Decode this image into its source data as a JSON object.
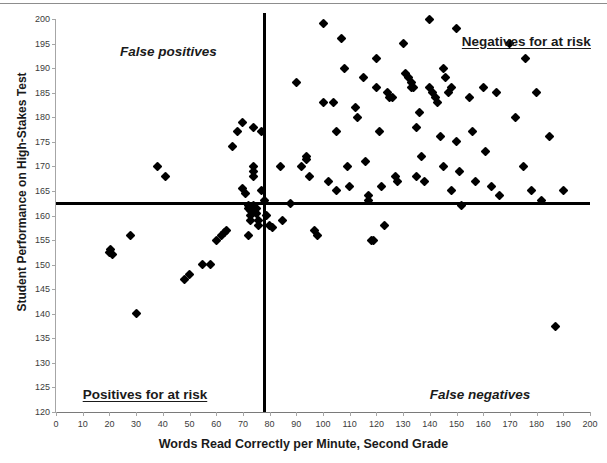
{
  "chart_data": {
    "type": "scatter",
    "title": "",
    "xlabel": "Words Read Correctly per Minute, Second Grade",
    "ylabel": "Student Performance on High-Stakes Test",
    "xlim": [
      0,
      200
    ],
    "ylim": [
      120,
      200
    ],
    "xticks": [
      0,
      10,
      20,
      30,
      40,
      50,
      60,
      70,
      80,
      90,
      100,
      110,
      120,
      130,
      140,
      150,
      160,
      170,
      180,
      190,
      200
    ],
    "yticks": [
      120,
      125,
      130,
      135,
      140,
      145,
      150,
      155,
      160,
      165,
      170,
      175,
      180,
      185,
      190,
      195,
      200
    ],
    "grid": false,
    "legend": "none",
    "marker": "diamond",
    "marker_color": "#000000",
    "thresholds": {
      "vertical_x": 78,
      "horizontal_y": 162.5,
      "line_color": "#000000"
    },
    "annotations": [
      {
        "text": "False positives",
        "x": 24,
        "y": 195,
        "style": "bold-italic",
        "quadrant": "upper-left"
      },
      {
        "text": "Negatives for at risk",
        "x": 152,
        "y": 197,
        "style": "bold-underline",
        "quadrant": "upper-right"
      },
      {
        "text": "Positives for at risk",
        "x": 10,
        "y": 125,
        "style": "bold-underline",
        "quadrant": "lower-left"
      },
      {
        "text": "False negatives",
        "x": 140,
        "y": 125,
        "style": "bold-italic",
        "quadrant": "lower-right"
      }
    ],
    "points": [
      [
        20,
        152.5
      ],
      [
        20.5,
        153
      ],
      [
        21,
        152
      ],
      [
        28,
        156
      ],
      [
        30,
        140
      ],
      [
        38,
        170
      ],
      [
        41,
        168
      ],
      [
        48,
        147
      ],
      [
        50,
        148
      ],
      [
        55,
        150
      ],
      [
        58,
        150
      ],
      [
        60,
        155
      ],
      [
        62,
        156
      ],
      [
        63,
        156.5
      ],
      [
        64,
        157
      ],
      [
        66,
        174
      ],
      [
        68,
        177
      ],
      [
        70,
        179
      ],
      [
        70,
        165.5
      ],
      [
        71,
        164.5
      ],
      [
        72,
        156
      ],
      [
        72,
        162
      ],
      [
        72,
        161.5
      ],
      [
        73,
        161
      ],
      [
        73,
        160
      ],
      [
        73,
        159
      ],
      [
        74,
        178
      ],
      [
        74,
        170
      ],
      [
        74,
        169
      ],
      [
        74,
        168
      ],
      [
        74,
        162
      ],
      [
        75,
        161.5
      ],
      [
        75,
        160.5
      ],
      [
        76,
        158
      ],
      [
        76,
        159
      ],
      [
        77,
        177
      ],
      [
        77,
        165
      ],
      [
        78,
        163
      ],
      [
        79,
        160
      ],
      [
        80,
        158
      ],
      [
        81,
        157.5
      ],
      [
        84,
        170
      ],
      [
        85,
        159
      ],
      [
        88,
        162.5
      ],
      [
        90,
        187
      ],
      [
        92,
        170
      ],
      [
        94,
        171.5
      ],
      [
        94,
        172
      ],
      [
        95,
        168
      ],
      [
        97,
        157
      ],
      [
        98,
        156
      ],
      [
        100,
        199
      ],
      [
        100,
        183
      ],
      [
        102,
        167
      ],
      [
        104,
        183
      ],
      [
        105,
        177
      ],
      [
        105,
        165
      ],
      [
        107,
        196
      ],
      [
        108,
        190
      ],
      [
        109,
        170
      ],
      [
        110,
        166
      ],
      [
        112,
        182
      ],
      [
        113,
        180
      ],
      [
        115,
        188
      ],
      [
        116,
        171
      ],
      [
        117,
        164
      ],
      [
        117,
        163
      ],
      [
        118,
        155
      ],
      [
        119,
        155
      ],
      [
        120,
        192
      ],
      [
        120,
        186
      ],
      [
        121,
        177
      ],
      [
        122,
        166
      ],
      [
        123,
        158
      ],
      [
        124,
        185
      ],
      [
        125,
        184
      ],
      [
        126,
        184
      ],
      [
        127,
        168
      ],
      [
        128,
        167
      ],
      [
        130,
        195
      ],
      [
        131,
        189
      ],
      [
        132,
        188
      ],
      [
        133,
        187
      ],
      [
        133,
        186
      ],
      [
        134,
        186
      ],
      [
        135,
        178
      ],
      [
        135,
        168
      ],
      [
        136,
        181
      ],
      [
        137,
        172
      ],
      [
        138,
        167
      ],
      [
        140,
        200
      ],
      [
        140,
        186
      ],
      [
        141,
        185
      ],
      [
        142,
        184
      ],
      [
        143,
        183
      ],
      [
        144,
        176
      ],
      [
        145,
        190
      ],
      [
        145,
        170
      ],
      [
        146,
        188
      ],
      [
        147,
        185
      ],
      [
        148,
        186
      ],
      [
        148,
        165
      ],
      [
        150,
        198
      ],
      [
        150,
        175
      ],
      [
        151,
        169
      ],
      [
        152,
        162
      ],
      [
        155,
        184
      ],
      [
        156,
        177
      ],
      [
        157,
        167
      ],
      [
        160,
        186
      ],
      [
        161,
        173
      ],
      [
        163,
        166
      ],
      [
        165,
        185
      ],
      [
        166,
        164
      ],
      [
        170,
        195
      ],
      [
        172,
        180
      ],
      [
        175,
        170
      ],
      [
        176,
        192
      ],
      [
        178,
        165
      ],
      [
        180,
        185
      ],
      [
        182,
        163
      ],
      [
        185,
        176
      ],
      [
        187,
        137.5
      ],
      [
        190,
        165
      ]
    ]
  },
  "axes": {
    "x_title": "Words Read Correctly per Minute, Second Grade",
    "y_title": "Student Performance on High-Stakes Test"
  }
}
